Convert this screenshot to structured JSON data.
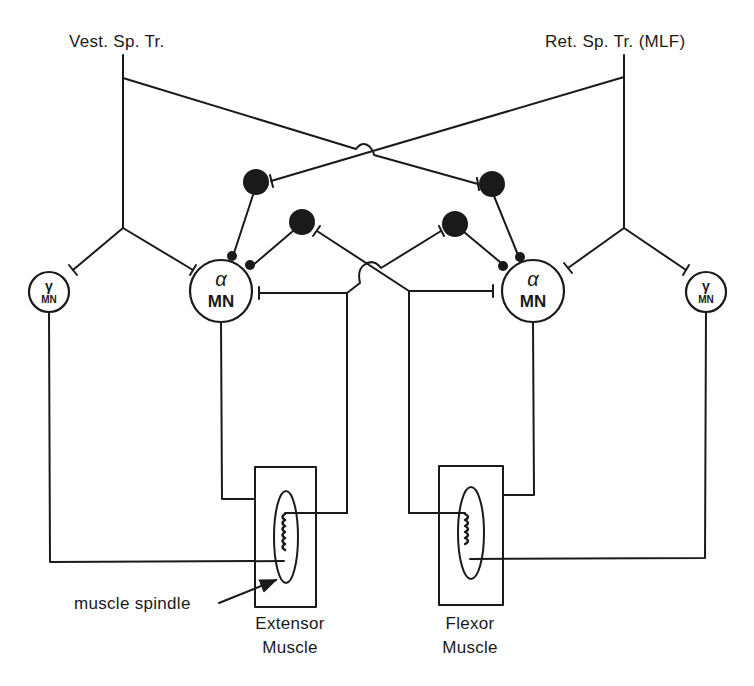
{
  "diagram": {
    "colors": {
      "ink": "#1a1a1a",
      "background": "#ffffff"
    },
    "tracts": {
      "left": {
        "label": "Vest. Sp. Tr."
      },
      "right": {
        "label": "Ret. Sp. Tr. (MLF)"
      }
    },
    "neurons": {
      "alpha_left": {
        "symbol": "α",
        "label": "MN"
      },
      "alpha_right": {
        "symbol": "α",
        "label": "MN"
      },
      "gamma_left": {
        "symbol": "γ",
        "label": "MN"
      },
      "gamma_right": {
        "symbol": "γ",
        "label": "MN"
      },
      "interneurons": [
        "inhibitory-interneuron",
        "inhibitory-interneuron",
        "inhibitory-interneuron",
        "inhibitory-interneuron"
      ]
    },
    "muscles": {
      "extensor": {
        "line1": "Extensor",
        "line2": "Muscle"
      },
      "flexor": {
        "line1": "Flexor",
        "line2": "Muscle"
      }
    },
    "annotations": {
      "spindle": "muscle spindle"
    }
  }
}
